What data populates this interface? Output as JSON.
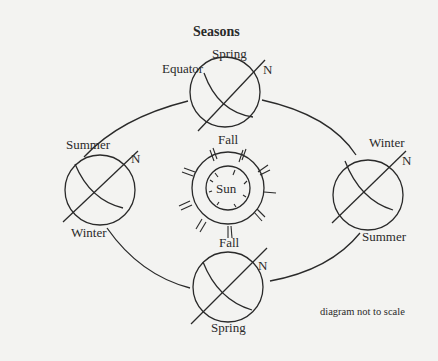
{
  "title": "Seasons",
  "note": "diagram not to scale",
  "colors": {
    "background": "#f3f3f1",
    "ink": "#2a2a2a"
  },
  "sun": {
    "label": "Sun"
  },
  "earth_positions": {
    "top": {
      "season_above": "Spring",
      "season_below": "Fall",
      "equator_label": "Equator",
      "north_label": "N"
    },
    "left": {
      "season_above": "Summer",
      "season_below": "Winter",
      "north_label": "N"
    },
    "right": {
      "season_above": "Winter",
      "season_below": "Summer",
      "north_label": "N"
    },
    "bottom": {
      "season_above": "Fall",
      "season_below": "Spring",
      "north_label": "N"
    }
  }
}
